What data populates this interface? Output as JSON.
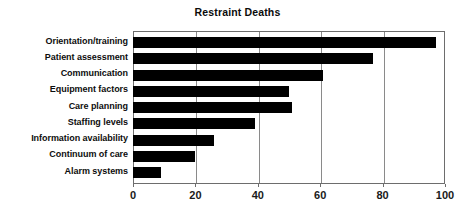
{
  "chart_data": {
    "type": "bar",
    "orientation": "horizontal",
    "title": "Restraint Deaths",
    "xlabel": "",
    "ylabel": "",
    "categories": [
      "Orientation/training",
      "Patient assessment",
      "Communication",
      "Equipment factors",
      "Care planning",
      "Staffing levels",
      "Information availability",
      "Continuum of care",
      "Alarm systems"
    ],
    "values": [
      97,
      77,
      61,
      50,
      51,
      39,
      26,
      20,
      9
    ],
    "xlim": [
      0,
      100
    ],
    "xticks": [
      0,
      20,
      40,
      60,
      80,
      100
    ],
    "xtick_labels": [
      "0",
      "20",
      "40",
      "60",
      "80",
      "100"
    ],
    "grid": true,
    "grid_axis": "x",
    "legend": false,
    "bar_color": "#000000",
    "background_color": "#ffffff",
    "axis_color": "#6d6d6d",
    "gridline_color": "#8a8a8a"
  }
}
